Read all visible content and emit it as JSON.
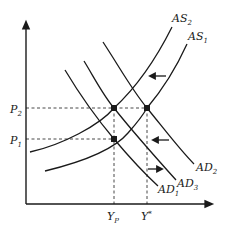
{
  "diagram": {
    "type": "AS-AD model",
    "axes": {
      "x_label": "",
      "y_label": ""
    },
    "price_levels": [
      {
        "id": "P2",
        "base": "P",
        "sub": "2"
      },
      {
        "id": "P1",
        "base": "P",
        "sub": "1"
      }
    ],
    "output_levels": [
      {
        "id": "YP",
        "base": "Y",
        "sub": "P"
      },
      {
        "id": "Ystar",
        "base": "Y",
        "sup": "*"
      }
    ],
    "curves": {
      "AS2": {
        "base": "AS",
        "sub": "2"
      },
      "AS1": {
        "base": "AS",
        "sub": "1"
      },
      "AD2": {
        "base": "AD",
        "sub": "2"
      },
      "AD3": {
        "base": "AD",
        "sub": "3"
      },
      "AD1": {
        "base": "AD",
        "sub": "1"
      }
    },
    "equilibrium_points": [
      {
        "at": "YP,P2"
      },
      {
        "at": "Ystar,P2"
      },
      {
        "at": "YP,P1"
      }
    ],
    "shift_arrows": [
      {
        "direction": "left",
        "near": "AD2"
      },
      {
        "direction": "left",
        "near": "AD3"
      },
      {
        "direction": "right",
        "near": "AD1"
      }
    ],
    "colors": {
      "line": "#1a1a1a",
      "background": "#ffffff"
    }
  }
}
